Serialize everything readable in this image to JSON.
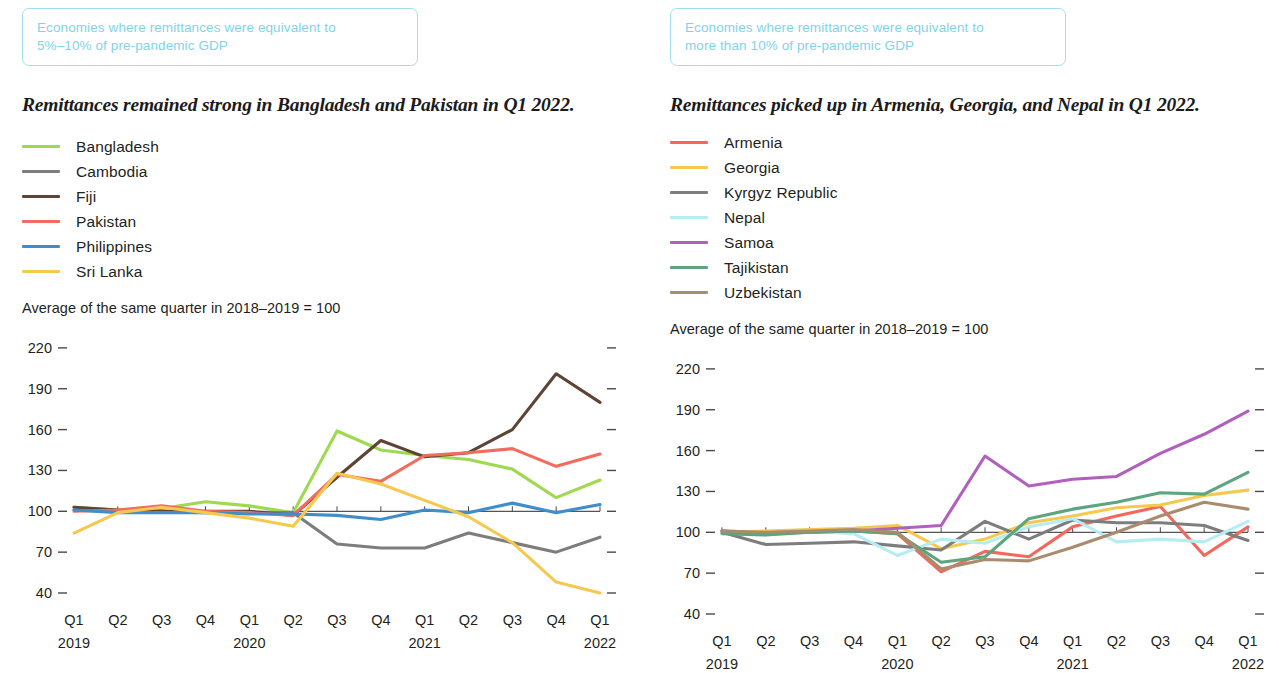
{
  "panels": [
    {
      "pill_line1": "Economies where remittances were equivalent to",
      "pill_line2": "5%–10% of pre-pandemic GDP",
      "headline": "Remittances remained strong in Bangladesh and Pakistan in Q1 2022.",
      "index_note": "Average of the same quarter in 2018–2019 = 100"
    },
    {
      "pill_line1": "Economies where remittances were equivalent to",
      "pill_line2": "more than 10% of pre-pandemic GDP",
      "headline": "Remittances picked up in Armenia, Georgia, and Nepal in Q1 2022.",
      "index_note": "Average of the same quarter in 2018–2019 = 100"
    }
  ],
  "axis": {
    "y_ticks": [
      220,
      190,
      160,
      130,
      100,
      70,
      40
    ],
    "y_min": 40,
    "y_max": 228,
    "x_quarters": [
      "Q1",
      "Q2",
      "Q3",
      "Q4",
      "Q1",
      "Q2",
      "Q3",
      "Q4",
      "Q1",
      "Q2",
      "Q3",
      "Q4",
      "Q1"
    ],
    "x_years": [
      "2019",
      "",
      "",
      "",
      "2020",
      "",
      "",
      "",
      "2021",
      "",
      "",
      "",
      "2022"
    ],
    "baseline_value": 100
  },
  "chart_data": [
    {
      "type": "line",
      "title": "Remittances remained strong in Bangladesh and Pakistan in Q1 2022.",
      "subtitle": "Economies where remittances were equivalent to 5%–10% of pre-pandemic GDP",
      "xlabel": "",
      "ylabel": "Average of the same quarter in 2018–2019 = 100",
      "ylim": [
        40,
        220
      ],
      "grid": false,
      "legend_position": "top-left",
      "categories": [
        "Q1 2019",
        "Q2 2019",
        "Q3 2019",
        "Q4 2019",
        "Q1 2020",
        "Q2 2020",
        "Q3 2020",
        "Q4 2020",
        "Q1 2021",
        "Q2 2021",
        "Q3 2021",
        "Q4 2021",
        "Q1 2022"
      ],
      "series": [
        {
          "name": "Bangladesh",
          "color": "#9ed94f",
          "values": [
            103,
            101,
            102,
            107,
            104,
            99,
            159,
            145,
            141,
            138,
            131,
            110,
            123
          ]
        },
        {
          "name": "Cambodia",
          "color": "#7d7d7d",
          "values": [
            101,
            100,
            100,
            99,
            99,
            99,
            76,
            73,
            73,
            84,
            77,
            70,
            81
          ]
        },
        {
          "name": "Fiji",
          "color": "#5d4437",
          "values": [
            103,
            101,
            100,
            100,
            100,
            97,
            125,
            152,
            140,
            143,
            160,
            201,
            180
          ]
        },
        {
          "name": "Pakistan",
          "color": "#f36a5e",
          "values": [
            100,
            101,
            104,
            100,
            99,
            97,
            127,
            122,
            141,
            143,
            146,
            133,
            142
          ]
        },
        {
          "name": "Philippines",
          "color": "#3f8ecb",
          "values": [
            101,
            99,
            99,
            99,
            98,
            98,
            97,
            94,
            101,
            99,
            106,
            99,
            105
          ]
        },
        {
          "name": "Sri Lanka",
          "color": "#f5c94f",
          "values": [
            84,
            99,
            103,
            99,
            95,
            89,
            128,
            120,
            108,
            96,
            77,
            48,
            40
          ]
        }
      ]
    },
    {
      "type": "line",
      "title": "Remittances picked up in Armenia, Georgia, and Nepal in Q1 2022.",
      "subtitle": "Economies where remittances were equivalent to more than 10% of pre-pandemic GDP",
      "xlabel": "",
      "ylabel": "Average of the same quarter in 2018–2019 = 100",
      "ylim": [
        40,
        220
      ],
      "grid": false,
      "legend_position": "top-left",
      "categories": [
        "Q1 2019",
        "Q2 2019",
        "Q3 2019",
        "Q4 2019",
        "Q1 2020",
        "Q2 2020",
        "Q3 2020",
        "Q4 2020",
        "Q1 2021",
        "Q2 2021",
        "Q3 2021",
        "Q4 2021",
        "Q1 2022"
      ],
      "series": [
        {
          "name": "Armenia",
          "color": "#f3685d",
          "values": [
            101,
            100,
            100,
            101,
            99,
            71,
            86,
            82,
            104,
            112,
            119,
            83,
            104
          ]
        },
        {
          "name": "Georgia",
          "color": "#f5c94f",
          "values": [
            100,
            101,
            102,
            103,
            105,
            88,
            95,
            107,
            112,
            118,
            120,
            127,
            131
          ]
        },
        {
          "name": "Kyrgyz Republic",
          "color": "#7d7d7d",
          "values": [
            100,
            91,
            92,
            93,
            90,
            87,
            108,
            95,
            109,
            107,
            107,
            105,
            94
          ]
        },
        {
          "name": "Nepal",
          "color": "#b6ecf2",
          "values": [
            100,
            99,
            101,
            99,
            83,
            95,
            92,
            104,
            110,
            93,
            95,
            93,
            108
          ]
        },
        {
          "name": "Samoa",
          "color": "#b060bd",
          "values": [
            101,
            99,
            100,
            101,
            103,
            105,
            156,
            134,
            139,
            141,
            158,
            172,
            189
          ]
        },
        {
          "name": "Tajikistan",
          "color": "#5ba57f",
          "values": [
            99,
            98,
            100,
            101,
            99,
            78,
            82,
            110,
            117,
            122,
            129,
            128,
            144
          ]
        },
        {
          "name": "Uzbekistan",
          "color": "#a98c6d",
          "values": [
            101,
            100,
            101,
            102,
            100,
            73,
            80,
            79,
            89,
            100,
            112,
            122,
            117
          ]
        }
      ]
    }
  ]
}
